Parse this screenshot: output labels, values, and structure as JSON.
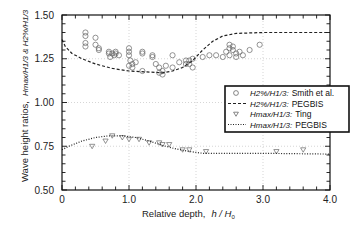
{
  "chart_data": {
    "type": "scatter",
    "title": "",
    "xlabel": "Relative depth,  h / H0",
    "ylabel": "Wave height ratios,  Hmax/H1/3 & H2%/H1/3",
    "xlim": [
      0,
      4.0
    ],
    "ylim": [
      0.5,
      1.5
    ],
    "x_ticks": [
      "0",
      "1.0",
      "2.0",
      "3.0",
      "4.0"
    ],
    "y_ticks": [
      "0.50",
      "0.75",
      "1.00",
      "1.25",
      "1.50"
    ],
    "grid": "dotted at major ticks",
    "legend_position": "right-middle, inside plot",
    "series": [
      {
        "name": "H2%/H1/3: Smith et al.",
        "kind": "scatter",
        "marker": "circle",
        "points": [
          [
            0.35,
            1.4
          ],
          [
            0.35,
            1.38
          ],
          [
            0.35,
            1.34
          ],
          [
            0.35,
            1.32
          ],
          [
            0.5,
            1.37
          ],
          [
            0.5,
            1.33
          ],
          [
            0.55,
            1.3
          ],
          [
            0.55,
            1.31
          ],
          [
            0.7,
            1.28
          ],
          [
            0.7,
            1.29
          ],
          [
            0.72,
            1.26
          ],
          [
            0.75,
            1.28
          ],
          [
            0.78,
            1.27
          ],
          [
            0.8,
            1.29
          ],
          [
            0.8,
            1.28
          ],
          [
            0.85,
            1.27
          ],
          [
            1.0,
            1.31
          ],
          [
            1.0,
            1.29
          ],
          [
            1.0,
            1.27
          ],
          [
            1.02,
            1.24
          ],
          [
            1.0,
            1.21
          ],
          [
            1.05,
            1.22
          ],
          [
            1.05,
            1.2
          ],
          [
            1.1,
            1.23
          ],
          [
            1.2,
            1.29
          ],
          [
            1.2,
            1.28
          ],
          [
            1.2,
            1.18
          ],
          [
            1.35,
            1.26
          ],
          [
            1.35,
            1.27
          ],
          [
            1.4,
            1.22
          ],
          [
            1.45,
            1.2
          ],
          [
            1.5,
            1.18
          ],
          [
            1.45,
            1.17
          ],
          [
            1.5,
            1.16
          ],
          [
            1.55,
            1.21
          ],
          [
            1.65,
            1.27
          ],
          [
            1.65,
            1.2
          ],
          [
            1.75,
            1.23
          ],
          [
            1.85,
            1.22
          ],
          [
            1.85,
            1.24
          ],
          [
            1.9,
            1.22
          ],
          [
            1.9,
            1.24
          ],
          [
            1.95,
            1.25
          ],
          [
            1.95,
            1.2
          ],
          [
            2.1,
            1.26
          ],
          [
            2.2,
            1.27
          ],
          [
            2.3,
            1.27
          ],
          [
            2.4,
            1.26
          ],
          [
            2.45,
            1.29
          ],
          [
            2.5,
            1.31
          ],
          [
            2.5,
            1.33
          ],
          [
            2.55,
            1.3
          ],
          [
            2.5,
            1.27
          ],
          [
            2.6,
            1.28
          ],
          [
            2.6,
            1.26
          ],
          [
            2.55,
            1.32
          ],
          [
            2.65,
            1.29
          ],
          [
            2.7,
            1.27
          ],
          [
            2.8,
            1.3
          ],
          [
            2.95,
            1.33
          ]
        ]
      },
      {
        "name": "H2%/H1/3: PEGBIS",
        "kind": "line",
        "style": "dashed",
        "points": [
          [
            0.0,
            1.36
          ],
          [
            0.05,
            1.32
          ],
          [
            0.15,
            1.28
          ],
          [
            0.3,
            1.25
          ],
          [
            0.5,
            1.22
          ],
          [
            0.75,
            1.195
          ],
          [
            1.0,
            1.18
          ],
          [
            1.25,
            1.175
          ],
          [
            1.5,
            1.17
          ],
          [
            1.65,
            1.18
          ],
          [
            1.8,
            1.2
          ],
          [
            1.95,
            1.24
          ],
          [
            2.1,
            1.3
          ],
          [
            2.25,
            1.35
          ],
          [
            2.4,
            1.38
          ],
          [
            2.6,
            1.395
          ],
          [
            3.0,
            1.4
          ],
          [
            4.0,
            1.4
          ]
        ]
      },
      {
        "name": "Hmax/H1/3: Ting",
        "kind": "scatter",
        "marker": "triangle-down",
        "points": [
          [
            0.45,
            0.75
          ],
          [
            0.65,
            0.78
          ],
          [
            0.75,
            0.81
          ],
          [
            0.9,
            0.8
          ],
          [
            1.0,
            0.79
          ],
          [
            1.15,
            0.79
          ],
          [
            1.3,
            0.77
          ],
          [
            1.45,
            0.77
          ],
          [
            1.5,
            0.76
          ],
          [
            1.6,
            0.76
          ],
          [
            1.8,
            0.73
          ],
          [
            1.9,
            0.73
          ],
          [
            2.15,
            0.72
          ],
          [
            3.2,
            0.72
          ],
          [
            3.6,
            0.73
          ]
        ]
      },
      {
        "name": "Hmax/H1/3: PEGBIS",
        "kind": "line",
        "style": "dotted",
        "points": [
          [
            0.0,
            0.73
          ],
          [
            0.1,
            0.75
          ],
          [
            0.3,
            0.78
          ],
          [
            0.5,
            0.8
          ],
          [
            0.7,
            0.81
          ],
          [
            0.9,
            0.81
          ],
          [
            1.1,
            0.8
          ],
          [
            1.3,
            0.78
          ],
          [
            1.5,
            0.755
          ],
          [
            1.7,
            0.735
          ],
          [
            1.9,
            0.72
          ],
          [
            2.1,
            0.71
          ],
          [
            2.5,
            0.71
          ],
          [
            3.0,
            0.71
          ],
          [
            4.0,
            0.705
          ]
        ]
      }
    ]
  },
  "axes": {
    "xlabel_main": "Relative depth,",
    "xlabel_var": "h / H",
    "xlabel_sub": "0",
    "ylabel_main": "Wave height ratios,",
    "ylabel_var": "Hmax/H1/3 & H2%/H1/3"
  },
  "legend": [
    {
      "symbol": "circle",
      "var": "H2%/H1/3:",
      "source": "Smith et al."
    },
    {
      "symbol": "dashed",
      "var": "H2%/H1/3:",
      "source": "PEGBIS"
    },
    {
      "symbol": "triangle-down",
      "var": "Hmax/H1/3:",
      "source": "Ting"
    },
    {
      "symbol": "dotted",
      "var": "Hmax/H1/3:",
      "source": "PEGBIS"
    }
  ]
}
